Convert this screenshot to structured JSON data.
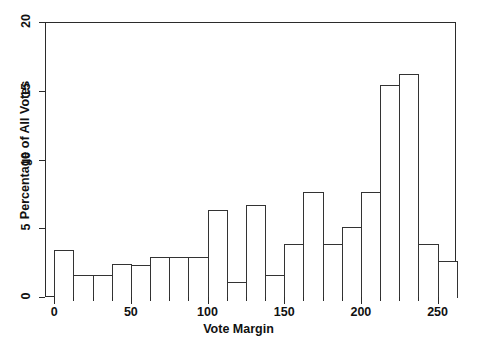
{
  "chart_data": {
    "type": "bar",
    "title": "",
    "xlabel": "Vote Margin",
    "ylabel": "Percentage of All Votes",
    "xlim": [
      -6,
      262
    ],
    "ylim": [
      0,
      20
    ],
    "grid": false,
    "legend": null,
    "bin_width": 12.5,
    "x_tick_labels": [
      "0",
      "50",
      "100",
      "150",
      "200",
      "250"
    ],
    "x_tick_values": [
      0,
      50,
      100,
      150,
      200,
      250
    ],
    "y_tick_labels": [
      "0",
      "5",
      "10",
      "15",
      "20"
    ],
    "y_tick_values": [
      0,
      5,
      10,
      15,
      20
    ],
    "bin_starts": [
      0,
      12.5,
      25,
      37.5,
      50,
      62.5,
      75,
      87.5,
      100,
      112.5,
      125,
      137.5,
      150,
      162.5,
      175,
      187.5,
      200,
      212.5,
      225,
      237.5,
      250
    ],
    "bin_ends": [
      12.5,
      25,
      37.5,
      50,
      62.5,
      75,
      87.5,
      100,
      112.5,
      125,
      137.5,
      150,
      162.5,
      175,
      187.5,
      200,
      212.5,
      225,
      237.5,
      250,
      262.5
    ],
    "categories": [
      "0-12.5",
      "12.5-25",
      "25-37.5",
      "37.5-50",
      "50-62.5",
      "62.5-75",
      "75-87.5",
      "87.5-100",
      "100-112.5",
      "112.5-125",
      "125-137.5",
      "137.5-150",
      "150-162.5",
      "162.5-175",
      "175-187.5",
      "187.5-200",
      "200-212.5",
      "212.5-225",
      "225-237.5",
      "237.5-250",
      "250-262.5"
    ],
    "values": [
      3.5,
      1.7,
      1.7,
      2.5,
      2.4,
      3.0,
      3.0,
      3.0,
      6.4,
      1.2,
      6.8,
      1.7,
      3.9,
      7.7,
      3.9,
      5.2,
      7.7,
      15.5,
      16.3,
      3.9,
      2.7
    ],
    "colors": {
      "bar_fill": "#ffffff",
      "bar_stroke": "#333333",
      "axis": "#2b2b2b",
      "text": "#111111",
      "background": "#ffffff"
    }
  },
  "watermark": {
    "text": ""
  }
}
